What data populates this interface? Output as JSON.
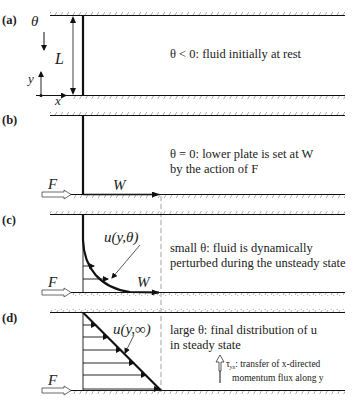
{
  "panels": [
    {
      "id": "a",
      "label": "(a)",
      "caption_line1": "θ < 0: fluid initially at rest",
      "caption_line2": ""
    },
    {
      "id": "b",
      "label": "(b)",
      "caption_line1": "θ = 0: lower plate is set at W",
      "caption_line2": "by the action of F"
    },
    {
      "id": "c",
      "label": "(c)",
      "caption_line1": "small θ: fluid is dynamically",
      "caption_line2": "perturbed during the unsteady state"
    },
    {
      "id": "d",
      "label": "(d)",
      "caption_line1": "large θ: final distribution of u",
      "caption_line2": "in steady state"
    }
  ],
  "symbols": {
    "theta": "θ",
    "L": "L",
    "y": "y",
    "x": "x",
    "F": "F",
    "W": "W",
    "u_transient": "u(y,θ)",
    "u_steady": "u(y,∞)"
  },
  "flux_note": {
    "symbol": "τyx",
    "sym_main": "τ",
    "sym_sub": "yx",
    "line1": ": transfer of x-directed",
    "line2": "momentum flux along y"
  },
  "colors": {
    "ink": "#111111",
    "hatch": "#777777",
    "dash": "#888888",
    "bg": "#ffffff"
  }
}
